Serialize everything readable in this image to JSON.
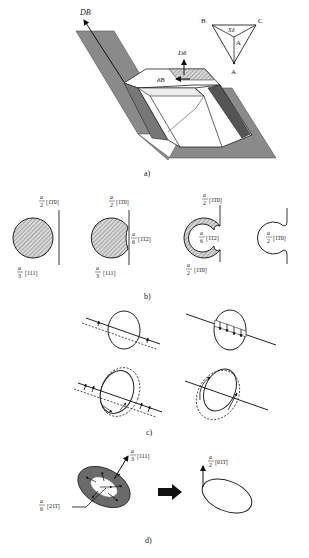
{
  "figure": {
    "panels": [
      {
        "id": "a",
        "caption": "a)",
        "labels": {
          "db": "DB",
          "d_delta": "Dδ",
          "delta_b": "δB",
          "triangle_b": "B",
          "triangle_c": "C",
          "triangle_a": "A",
          "triangle_inner_a": "A",
          "triangle_inner_delta": "Xδ"
        }
      },
      {
        "id": "b",
        "caption": "b)",
        "items": [
          {
            "top_num": "a",
            "top_den": "2",
            "top_vec": "[1̄1̄0]",
            "bottom_num": "a",
            "bottom_den": "3",
            "bottom_vec": "[111]"
          },
          {
            "top_num": "a",
            "top_den": "2",
            "top_vec": "[1̄1̄0]",
            "side_num": "a",
            "side_den": "6",
            "side_vec": "[1̄1̄2]",
            "bottom_num": "a",
            "bottom_den": "3",
            "bottom_vec": "[111]"
          },
          {
            "top_num": "a",
            "top_den": "2",
            "top_vec": "[1̄1̄0]",
            "side_num": "a",
            "side_den": "6",
            "side_vec": "[1̄1̄2]",
            "bottom_num": "a",
            "bottom_den": "2",
            "bottom_vec": "[1̄1̄0]"
          },
          {
            "side_num": "a",
            "side_den": "2",
            "side_vec": "[1̄1̄0]"
          }
        ]
      },
      {
        "id": "c",
        "caption": "c)"
      },
      {
        "id": "d",
        "caption": "d)",
        "labels": {
          "normal_num": "a",
          "normal_den": "3",
          "normal_vec": "[111]",
          "partial_num": "a",
          "partial_den": "6",
          "partial_vec": "[21̄1̄]",
          "result_num": "a",
          "result_den": "2",
          "result_vec": "[01̄1̄]"
        }
      }
    ]
  }
}
